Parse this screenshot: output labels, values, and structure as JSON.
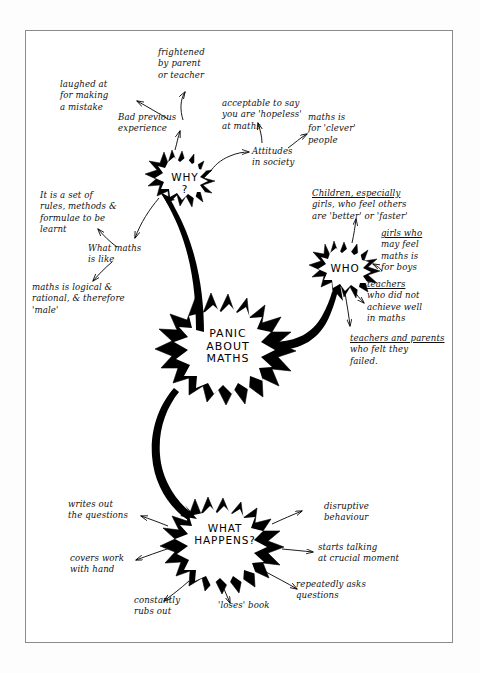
{
  "diagram": {
    "title": "Panic About Maths",
    "frame": {
      "border_color": "#8b8b8b"
    },
    "ink_color": "#000000",
    "background_color": "#ffffff"
  },
  "nodes": {
    "why": {
      "label": "WHY\n?"
    },
    "who": {
      "label": "WHO"
    },
    "center": {
      "label": "PANIC\nABOUT\nMATHS"
    },
    "what_happens": {
      "label": "WHAT\nHAPPENS?"
    }
  },
  "labels": {
    "frightened": "frightened\nby parent\nor teacher",
    "laughed_at": "laughed at\nfor making\na mistake",
    "bad_previous": "Bad previous\nexperience",
    "acceptable": "acceptable to say\nyou are 'hopeless'\nat maths",
    "maths_clever": "maths is\nfor 'clever'\npeople",
    "attitudes": "Attitudes\nin society",
    "children_girls": "Children, especially\ngirls, who feel others\nare 'better' or 'faster'",
    "girls_for_boys": "girls who\nmay feel\nmaths is\nfor boys",
    "teachers_not_achieve": "teachers\nwho did not\nachieve well\nin maths",
    "teachers_parents_failed": "teachers and parents\nwho felt they\nfailed.",
    "set_of_rules": "It is a set of\nrules, methods &\nformulae to be\nlearnt",
    "what_maths_like": "What maths\nis like",
    "maths_logical": "maths is logical &\nrational, & therefore\n'male'",
    "writes_out": "writes out\nthe questions",
    "covers_work": "covers work\nwith hand",
    "constantly_rubs": "constantly\nrubs out",
    "loses_book": "'loses' book",
    "disruptive": "disruptive\nbehaviour",
    "starts_talking": "starts talking\nat crucial moment",
    "repeatedly_asks": "repeatedly asks\nquestions"
  }
}
